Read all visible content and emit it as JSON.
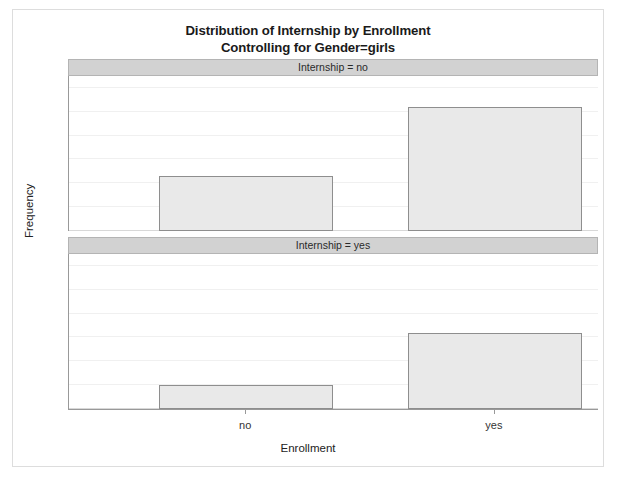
{
  "title": {
    "line1": "Distribution of Internship by Enrollment",
    "line2": "Controlling for Gender=girls"
  },
  "axes": {
    "ylabel": "Frequency",
    "xlabel": "Enrollment"
  },
  "panels": [
    {
      "header": "Internship = no"
    },
    {
      "header": "Internship = yes"
    }
  ],
  "colors": {
    "bar_fill": "#e9e9e9",
    "bar_border": "#8e8e8e",
    "panel_header": "#d2d2d2",
    "gridline": "#f0f0f0",
    "axis": "#999999",
    "card_border": "#dddddd"
  },
  "chart_data": {
    "type": "bar",
    "title": "Distribution of Internship by Enrollment Controlling for Gender=girls",
    "xlabel": "Enrollment",
    "ylabel": "Frequency",
    "categories": [
      "no",
      "yes"
    ],
    "ylim": [
      0,
      65
    ],
    "yticks": [
      0,
      10,
      20,
      30,
      40,
      50,
      60
    ],
    "ytick_labels": [
      "0",
      "10",
      "20",
      "30",
      "40",
      "50",
      "60"
    ],
    "grid": true,
    "legend": "none",
    "panel_variable": "Internship",
    "panels": [
      {
        "label": "Internship = no",
        "values": [
          23,
          52
        ]
      },
      {
        "label": "Internship = yes",
        "values": [
          10,
          32
        ]
      }
    ]
  }
}
